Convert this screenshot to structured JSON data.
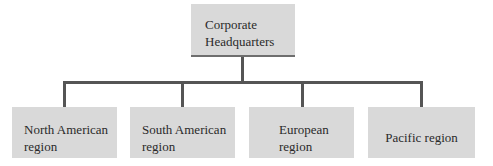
{
  "diagram": {
    "type": "org-chart",
    "root": {
      "label_lines": [
        "Corporate",
        "Headquarters"
      ]
    },
    "children": [
      {
        "label_lines": [
          "North American",
          "region"
        ]
      },
      {
        "label_lines": [
          "South American",
          "region"
        ]
      },
      {
        "label_lines": [
          "European",
          "region"
        ]
      },
      {
        "label_lines": [
          "Pacific region"
        ]
      }
    ],
    "colors": {
      "box_fill": "#d9d9d9",
      "connector": "#555555",
      "text": "#2a2a2a"
    }
  }
}
